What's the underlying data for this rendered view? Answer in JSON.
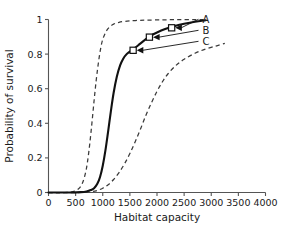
{
  "chart_data": {
    "type": "line",
    "title": "",
    "xlabel": "Habitat capacity",
    "ylabel": "Probability of survival",
    "xlim": [
      0,
      4000
    ],
    "ylim": [
      0,
      1
    ],
    "xticks": [
      0,
      500,
      1000,
      1500,
      2000,
      2500,
      3000,
      3500,
      4000
    ],
    "xtick_labels": [
      "0",
      "500",
      "1000",
      "1500",
      "2000",
      "2500",
      "3000",
      "3500",
      "4000"
    ],
    "yticks": [
      0,
      0.2,
      0.4,
      0.6,
      0.8,
      1
    ],
    "ytick_labels": [
      "0",
      "0.2",
      "0.4",
      "0.6",
      "0.8",
      "1"
    ],
    "grid": false,
    "legend_position": "inline-annotations",
    "series": [
      {
        "name": "A",
        "style": "dashed",
        "label": "A",
        "comment": "steep left sigmoid, saturates at 1",
        "x": [
          0,
          300,
          450,
          550,
          620,
          680,
          720,
          760,
          800,
          840,
          880,
          920,
          960,
          1000,
          1060,
          1120,
          1200,
          1300,
          1450,
          1600,
          1800,
          2100,
          2400,
          2700,
          2900
        ],
        "y": [
          0.0,
          0.0,
          0.005,
          0.02,
          0.05,
          0.11,
          0.18,
          0.28,
          0.4,
          0.53,
          0.65,
          0.75,
          0.83,
          0.885,
          0.93,
          0.955,
          0.973,
          0.984,
          0.991,
          0.994,
          0.996,
          0.998,
          0.999,
          0.999,
          1.0
        ]
      },
      {
        "name": "B",
        "style": "solid",
        "label": "B",
        "comment": "central sigmoid through the three markers",
        "x": [
          0,
          400,
          600,
          700,
          780,
          840,
          900,
          950,
          1000,
          1050,
          1100,
          1150,
          1200,
          1260,
          1320,
          1380,
          1440,
          1500,
          1560,
          1650,
          1760,
          1880,
          2000,
          2150,
          2300,
          2500,
          2700,
          2900
        ],
        "y": [
          0.0,
          0.0,
          0.002,
          0.006,
          0.014,
          0.025,
          0.05,
          0.09,
          0.155,
          0.245,
          0.355,
          0.47,
          0.575,
          0.67,
          0.735,
          0.775,
          0.8,
          0.815,
          0.828,
          0.85,
          0.878,
          0.905,
          0.925,
          0.945,
          0.96,
          0.975,
          0.987,
          0.996
        ]
      },
      {
        "name": "C",
        "style": "dashed",
        "label": "C",
        "comment": "right shifted sigmoid plateauing near 0.86",
        "x": [
          0,
          600,
          800,
          900,
          1000,
          1100,
          1200,
          1300,
          1400,
          1500,
          1600,
          1700,
          1800,
          1900,
          2000,
          2100,
          2200,
          2350,
          2500,
          2700,
          2900,
          3100,
          3250
        ],
        "y": [
          0.0,
          0.0,
          0.005,
          0.012,
          0.025,
          0.045,
          0.075,
          0.115,
          0.165,
          0.225,
          0.295,
          0.37,
          0.45,
          0.52,
          0.585,
          0.64,
          0.685,
          0.735,
          0.77,
          0.805,
          0.83,
          0.848,
          0.862
        ]
      }
    ],
    "markers": [
      {
        "label": "A",
        "x": 2270,
        "y": 0.952
      },
      {
        "label": "B",
        "x": 1860,
        "y": 0.898
      },
      {
        "label": "C",
        "x": 1560,
        "y": 0.822
      }
    ],
    "annotations": [
      {
        "label": "A",
        "text": "A"
      },
      {
        "label": "B",
        "text": "B"
      },
      {
        "label": "C",
        "text": "C"
      }
    ],
    "colors": {
      "solid_curve": "#111111",
      "dashed_curve": "#3a3a3a",
      "axis": "#555555",
      "text": "#1a1a1a",
      "background": "#ffffff"
    }
  }
}
